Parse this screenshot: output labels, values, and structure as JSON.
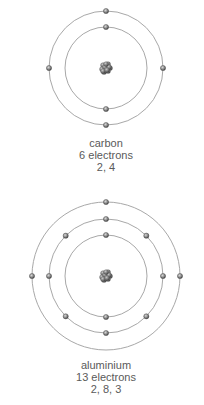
{
  "colors": {
    "background": "#ffffff",
    "orbit": "#a8a8a8",
    "electron_fill": "#8a8a8a",
    "electron_edge": "#4a4a4a",
    "nucleus": "#6e6e6e",
    "label_text": "#5a5a5a"
  },
  "atoms": [
    {
      "name": "carbon",
      "electron_count_label": "6 electrons",
      "configuration": "2, 4",
      "shells": [
        2,
        4
      ],
      "center": [
        106,
        68
      ],
      "shell_radii": [
        41,
        57
      ],
      "label_top": 137
    },
    {
      "name": "aluminium",
      "electron_count_label": "13 electrons",
      "configuration": "2, 8, 3",
      "shells": [
        2,
        8,
        3
      ],
      "center": [
        106,
        276
      ],
      "shell_radii": [
        41,
        57,
        74
      ],
      "label_top": 359
    }
  ]
}
